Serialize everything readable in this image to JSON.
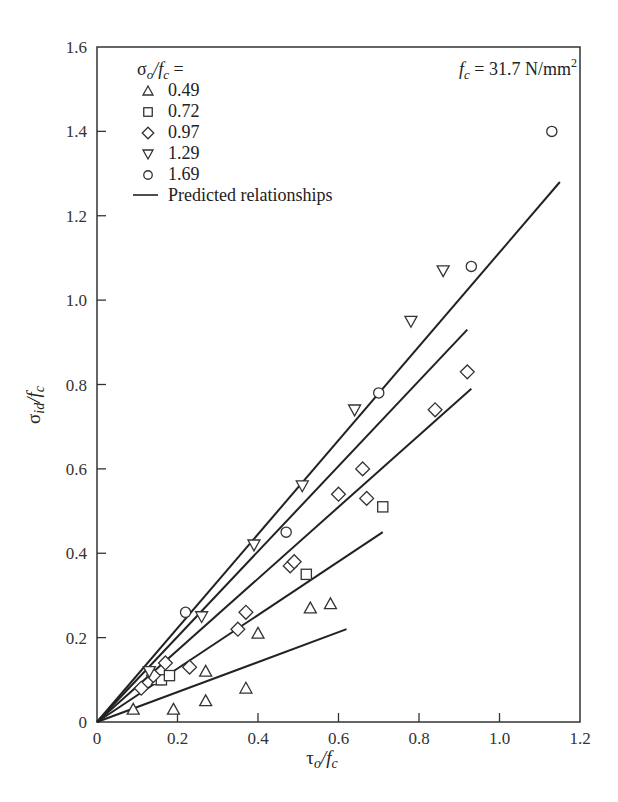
{
  "chart_data": {
    "type": "scatter",
    "title": "",
    "xlabel": "τo/fc",
    "ylabel": "σid/fc",
    "xlim": [
      0,
      1.2
    ],
    "ylim": [
      0,
      1.6
    ],
    "x_ticks": [
      "0",
      "0.2",
      "0.4",
      "0.6",
      "0.8",
      "1.0",
      "1.2"
    ],
    "y_ticks": [
      "0",
      "0.2",
      "0.4",
      "0.6",
      "0.8",
      "1.0",
      "1.2",
      "1.4",
      "1.6"
    ],
    "grid": false,
    "legend_title": "σo/fc =",
    "legend_position": "upper-left",
    "annotation": "fc = 31.7 N/mm²",
    "series": [
      {
        "name": "0.49",
        "marker": "triangle-up",
        "points": [
          [
            0.09,
            0.03
          ],
          [
            0.15,
            0.1
          ],
          [
            0.19,
            0.03
          ],
          [
            0.27,
            0.05
          ],
          [
            0.27,
            0.12
          ],
          [
            0.37,
            0.08
          ],
          [
            0.4,
            0.21
          ],
          [
            0.53,
            0.27
          ],
          [
            0.58,
            0.28
          ]
        ],
        "predicted_line": [
          [
            0,
            0
          ],
          [
            0.62,
            0.22
          ]
        ]
      },
      {
        "name": "0.72",
        "marker": "square",
        "points": [
          [
            0.16,
            0.1
          ],
          [
            0.18,
            0.11
          ],
          [
            0.52,
            0.35
          ],
          [
            0.71,
            0.51
          ]
        ],
        "predicted_line": [
          [
            0,
            0
          ],
          [
            0.71,
            0.45
          ]
        ]
      },
      {
        "name": "0.97",
        "marker": "diamond",
        "points": [
          [
            0.11,
            0.08
          ],
          [
            0.14,
            0.11
          ],
          [
            0.17,
            0.14
          ],
          [
            0.23,
            0.13
          ],
          [
            0.35,
            0.22
          ],
          [
            0.37,
            0.26
          ],
          [
            0.48,
            0.37
          ],
          [
            0.49,
            0.38
          ],
          [
            0.6,
            0.54
          ],
          [
            0.66,
            0.6
          ],
          [
            0.67,
            0.53
          ],
          [
            0.84,
            0.74
          ],
          [
            0.92,
            0.83
          ]
        ],
        "predicted_line": [
          [
            0,
            0
          ],
          [
            0.93,
            0.79
          ]
        ]
      },
      {
        "name": "1.29",
        "marker": "triangle-down",
        "points": [
          [
            0.13,
            0.12
          ],
          [
            0.26,
            0.25
          ],
          [
            0.39,
            0.42
          ],
          [
            0.51,
            0.56
          ],
          [
            0.64,
            0.74
          ],
          [
            0.78,
            0.95
          ],
          [
            0.86,
            1.07
          ]
        ],
        "predicted_line": [
          [
            0,
            0
          ],
          [
            0.92,
            0.93
          ]
        ]
      },
      {
        "name": "1.69",
        "marker": "circle",
        "points": [
          [
            0.22,
            0.26
          ],
          [
            0.47,
            0.45
          ],
          [
            0.7,
            0.78
          ],
          [
            0.93,
            1.08
          ],
          [
            1.13,
            1.4
          ]
        ],
        "predicted_line": [
          [
            0,
            0
          ],
          [
            1.15,
            1.28
          ]
        ]
      }
    ],
    "legend_entries": [
      "0.49",
      "0.72",
      "0.97",
      "1.29",
      "1.69",
      "Predicted relationships"
    ]
  },
  "labels": {
    "legend_title": "σo/fc =",
    "legend_line": "Predicted relationships",
    "annotation_prefix": "fc",
    "annotation_value": " = 31.7 N/mm",
    "annotation_sup": "2",
    "xlabel_main": "τ",
    "xlabel_sub": "o",
    "xlabel_div": "/f",
    "xlabel_sub2": "c",
    "ylabel_main": "σ",
    "ylabel_sub": "id",
    "ylabel_div": "/f",
    "ylabel_sub2": "c"
  },
  "colors": {
    "ink": "#222222",
    "background": "#ffffff"
  }
}
